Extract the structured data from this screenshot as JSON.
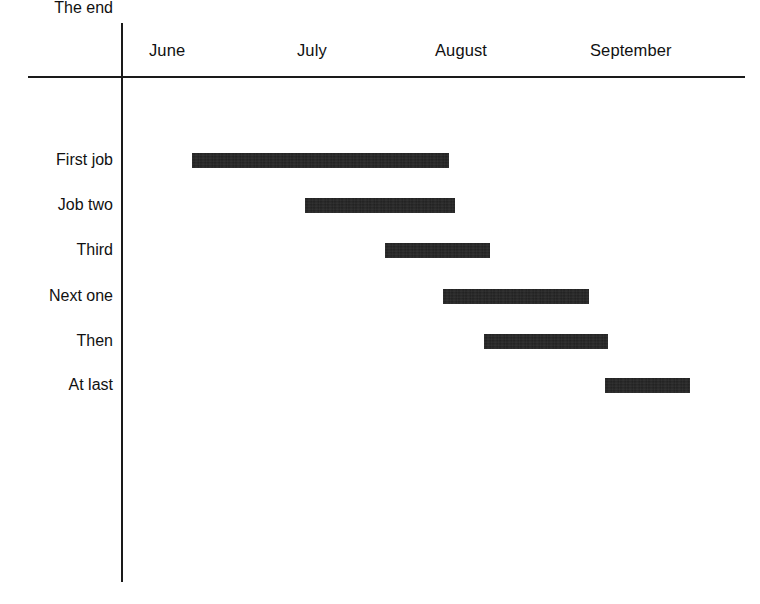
{
  "chart_data": {
    "type": "bar",
    "subtype": "gantt",
    "title": "",
    "xlabel": "",
    "ylabel": "",
    "orientation": "horizontal",
    "grid": false,
    "legend": null,
    "axis": {
      "x_tick_labels": [
        "June",
        "July",
        "August",
        "September"
      ],
      "x_tick_positions": [
        149,
        297,
        435,
        590
      ],
      "x_range_px": [
        122,
        745
      ],
      "month_width_px": 145
    },
    "categories": [
      "First job",
      "Job two",
      "Third",
      "Next one",
      "Then",
      "At last",
      "The end"
    ],
    "tasks": [
      {
        "label": "First job",
        "start_px": 138,
        "end_px": 408,
        "top_px": 109,
        "start_month": "June",
        "end_month": "July"
      },
      {
        "label": "Job two",
        "start_px": 192,
        "end_px": 449,
        "top_px": 153,
        "start_month": "June",
        "end_month": "August"
      },
      {
        "label": "Third",
        "start_px": 305,
        "end_px": 455,
        "top_px": 198,
        "start_month": "July",
        "end_month": "August"
      },
      {
        "label": "Next one",
        "start_px": 385,
        "end_px": 490,
        "top_px": 243,
        "start_month": "July",
        "end_month": "August"
      },
      {
        "label": "Then",
        "start_px": 443,
        "end_px": 589,
        "top_px": 289,
        "start_month": "August",
        "end_month": "September"
      },
      {
        "label": "At last",
        "start_px": 484,
        "end_px": 608,
        "top_px": 334,
        "start_month": "August",
        "end_month": "September"
      },
      {
        "label": "The end",
        "start_px": 605,
        "end_px": 690,
        "top_px": 378,
        "start_month": "September",
        "end_month": "September"
      }
    ],
    "label_tops": [
      108,
      152,
      197,
      242,
      288,
      333,
      377
    ],
    "colors": {
      "bar": "#1f1f1f",
      "axis": "#1a1a1a",
      "text": "#111111",
      "background": "#ffffff"
    }
  },
  "months": [
    {
      "label": "June",
      "left": 149
    },
    {
      "label": "July",
      "left": 297
    },
    {
      "label": "August",
      "left": 435
    },
    {
      "label": "September",
      "left": 590
    }
  ],
  "rows": [
    {
      "label": "First job"
    },
    {
      "label": "Job two"
    },
    {
      "label": "Third"
    },
    {
      "label": "Next one"
    },
    {
      "label": "Then"
    },
    {
      "label": "At last"
    },
    {
      "label": "The end"
    }
  ]
}
